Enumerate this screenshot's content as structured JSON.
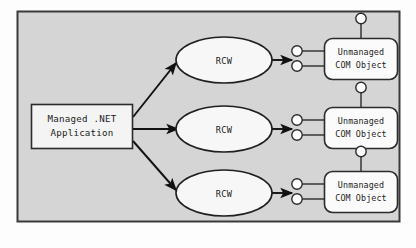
{
  "diagram": {
    "frame": {
      "name": "diagram-frame",
      "fill": "#d5d5d5",
      "stroke": "#3a3a3a"
    },
    "client": {
      "line1": "Managed .NET",
      "line2": "Application",
      "fill": "#f4f4f4",
      "stroke": "#2b2b2b"
    },
    "wrappers": [
      {
        "label": "RCW"
      },
      {
        "label": "RCW"
      },
      {
        "label": "RCW"
      }
    ],
    "wrapper_style": {
      "fill": "#f7f7f7",
      "stroke": "#1f1f1f"
    },
    "com_objects": [
      {
        "line1": "Unmanaged",
        "line2": "COM Object"
      },
      {
        "line1": "Unmanaged",
        "line2": "COM Object"
      },
      {
        "line1": "Unmanaged",
        "line2": "COM Object"
      }
    ],
    "com_style": {
      "fill": "#fbfbfb",
      "stroke": "#2b2b2b"
    },
    "interface_lollipops": {
      "per_object_left": 2,
      "per_object_top": 1,
      "fill": "#ffffff",
      "stroke": "#2b2b2b"
    },
    "arrows": {
      "count": 6,
      "color": "#111111",
      "description": "three arrows fan out from the managed application to each RCW, and one arrow from each RCW to its COM object"
    }
  }
}
